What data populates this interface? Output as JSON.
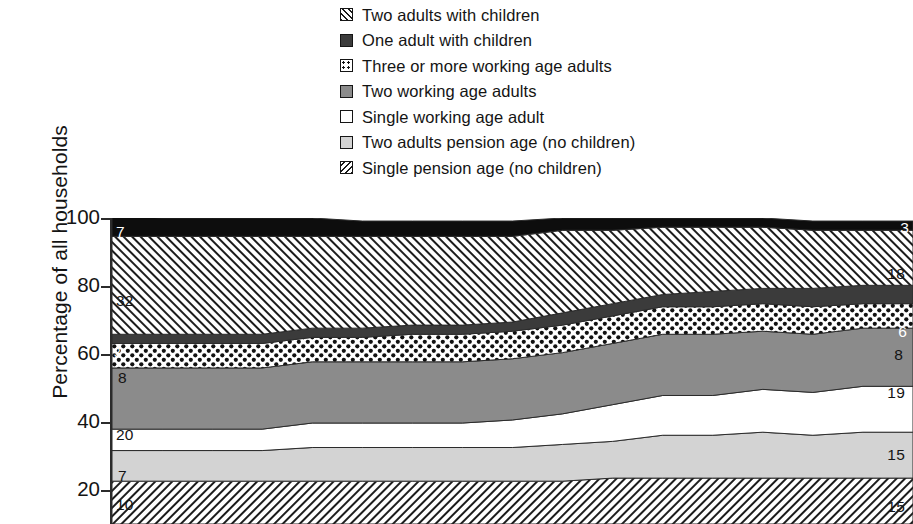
{
  "legend": {
    "items": [
      {
        "label": "Two adults with children",
        "pattern": "p-hatch-fwd",
        "icon": "hatch-forward-swatch-icon"
      },
      {
        "label": "One adult with children",
        "pattern": "p-solid-dark",
        "icon": "dark-gray-swatch-icon"
      },
      {
        "label": "Three or more working age adults",
        "pattern": "p-dots",
        "icon": "dotted-swatch-icon"
      },
      {
        "label": "Two working age adults",
        "pattern": "p-mid-gray",
        "icon": "mid-gray-swatch-icon"
      },
      {
        "label": "Single working age adult",
        "pattern": "p-white",
        "icon": "white-swatch-icon"
      },
      {
        "label": "Two adults pension age (no children)",
        "pattern": "p-light-gray",
        "icon": "light-gray-swatch-icon"
      },
      {
        "label": "Single pension age (no children)",
        "pattern": "p-hatch-back",
        "icon": "hatch-backward-swatch-icon"
      }
    ]
  },
  "axis": {
    "ylabel": "Percentage of all households",
    "yticks": [
      "100",
      "80",
      "60",
      "40",
      "20"
    ]
  },
  "labels": {
    "left": [
      "7",
      "32",
      "3",
      "8",
      "20",
      "7",
      "10"
    ],
    "right": [
      "3",
      "18",
      "6",
      "8",
      "19",
      "15",
      "15"
    ]
  },
  "chart_data": {
    "type": "area",
    "title": "",
    "xlabel": "",
    "ylabel": "Percentage of all households",
    "ylim": [
      0,
      100
    ],
    "yticks": [
      20,
      40,
      60,
      80,
      100
    ],
    "grid": false,
    "stacked": true,
    "stack_order_top_to_bottom": [
      "One adult with children",
      "Two adults with children",
      "Three or more working age adults",
      "Two working age adults",
      "Single working age adult",
      "Two adults pension age (no children)",
      "Single pension age (no children)"
    ],
    "legend_position": "above-plot",
    "note": "100% stacked area chart of UK household composition over time; x axis tick labels are cropped out of this screenshot.",
    "x": [
      0,
      1,
      2,
      3,
      4,
      5,
      6,
      7,
      8,
      9,
      10,
      11,
      12,
      13,
      14,
      15,
      16
    ],
    "series": [
      {
        "name": "Single pension age (no children)",
        "start_value": 14,
        "end_value": 15,
        "values": [
          14,
          14,
          14,
          14,
          14,
          14,
          14,
          14,
          14,
          14,
          15,
          15,
          15,
          15,
          15,
          15,
          15
        ]
      },
      {
        "name": "Two adults pension age (no children)",
        "start_value": 10,
        "end_value": 15,
        "values": [
          10,
          10,
          10,
          10,
          11,
          11,
          11,
          11,
          11,
          12,
          12,
          14,
          14,
          15,
          14,
          15,
          15
        ]
      },
      {
        "name": "Single working age adult",
        "start_value": 7,
        "end_value": 15,
        "values": [
          7,
          7,
          7,
          7,
          8,
          8,
          8,
          8,
          9,
          10,
          12,
          13,
          13,
          14,
          14,
          15,
          15
        ]
      },
      {
        "name": "Two working age adults",
        "start_value": 20,
        "end_value": 19,
        "values": [
          20,
          20,
          20,
          20,
          20,
          20,
          20,
          20,
          20,
          20,
          20,
          20,
          20,
          19,
          19,
          19,
          19
        ]
      },
      {
        "name": "Three or more working age adults",
        "start_value": 8,
        "end_value": 8,
        "values": [
          8,
          8,
          8,
          8,
          8,
          8,
          9,
          9,
          9,
          9,
          9,
          9,
          9,
          9,
          9,
          8,
          8
        ]
      },
      {
        "name": "One adult with children",
        "start_value": 3,
        "end_value": 6,
        "values": [
          3,
          3,
          3,
          3,
          3,
          3,
          3,
          3,
          3,
          4,
          4,
          4,
          5,
          5,
          6,
          6,
          6
        ]
      },
      {
        "name": "Two adults with children",
        "start_value": 32,
        "end_value": 18,
        "values": [
          32,
          32,
          32,
          32,
          30,
          30,
          29,
          29,
          28,
          27,
          24,
          22,
          21,
          20,
          19,
          18,
          18
        ]
      },
      {
        "name": "Single pension age cap (top band)",
        "start_value": 7,
        "end_value": 3,
        "values": [
          7,
          6,
          6,
          6,
          6,
          5,
          5,
          5,
          5,
          4,
          4,
          3,
          3,
          3,
          3,
          3,
          3
        ]
      }
    ]
  }
}
